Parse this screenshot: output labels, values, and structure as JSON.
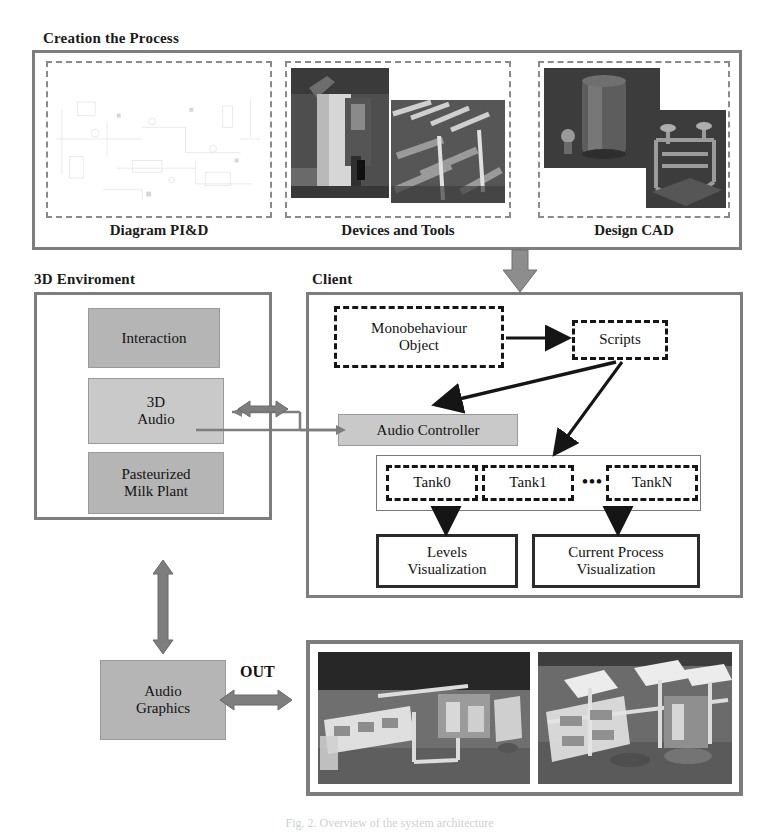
{
  "figure": {
    "caption": "Fig. 2.  Overview of the system architecture"
  },
  "creation_panel": {
    "title": "Creation the Process",
    "items": [
      {
        "label": "Diagram PI&D",
        "content": "pid-schematic-drawing"
      },
      {
        "label": "Devices and Tools",
        "content": "plant-equipment-photographs"
      },
      {
        "label": "Design CAD",
        "content": "cad-model-renders"
      }
    ]
  },
  "environment_panel": {
    "title": "3D Enviroment",
    "boxes": [
      {
        "label": "Interaction"
      },
      {
        "label": "3D\nAudio",
        "line1": "3D",
        "line2": "Audio"
      },
      {
        "label": "Pasteurized Milk Plant",
        "line1": "Pasteurized",
        "line2": "Milk Plant"
      }
    ]
  },
  "client_panel": {
    "title": "Client",
    "monobehaviour": {
      "line1": "Monobehaviour",
      "line2": "Object"
    },
    "scripts": {
      "label": "Scripts"
    },
    "audio_controller": {
      "label": "Audio Controller"
    },
    "tanks": {
      "items": [
        "Tank0",
        "Tank1",
        "TankN"
      ],
      "ellipsis": "•••"
    },
    "visualizations": [
      {
        "line1": "Levels",
        "line2": "Visualization"
      },
      {
        "line1": "Current Process",
        "line2": "Visualization"
      }
    ]
  },
  "output_section": {
    "audio_graphics": {
      "line1": "Audio",
      "line2": "Graphics"
    },
    "out_label": "OUT",
    "screenshots": [
      {
        "name": "virtual-plant-view-1"
      },
      {
        "name": "virtual-plant-view-2"
      }
    ]
  },
  "colors": {
    "panel_border": "#7d7d7d",
    "grey_box": "#b5b5b5",
    "grey_box_light": "#c9c9c9",
    "arrow_grey": "#808080",
    "arrow_black": "#151515"
  }
}
